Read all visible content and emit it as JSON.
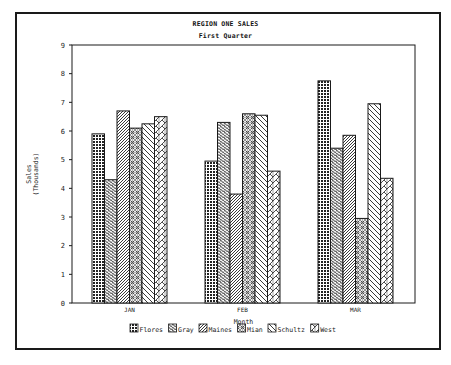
{
  "chart_data": {
    "type": "bar",
    "title": "REGION ONE SALES",
    "subtitle": "First Quarter",
    "xlabel": "Month",
    "ylabel": "Sales",
    "ylabel_sub": "(Thousands)",
    "categories": [
      "JAN",
      "FEB",
      "MAR"
    ],
    "ylim": [
      0,
      9
    ],
    "yticks": [
      0,
      1,
      2,
      3,
      4,
      5,
      6,
      7,
      8,
      9
    ],
    "grid": false,
    "legend_position": "bottom",
    "series": [
      {
        "name": "Flores",
        "pattern": "dense-dots",
        "values": [
          5.9,
          4.95,
          7.75
        ]
      },
      {
        "name": "Gray",
        "pattern": "herringbone-fine",
        "values": [
          4.3,
          6.3,
          5.4
        ]
      },
      {
        "name": "Maines",
        "pattern": "diagonal-fine",
        "values": [
          6.7,
          3.8,
          5.85
        ]
      },
      {
        "name": "Mian",
        "pattern": "crosshatch-circles",
        "values": [
          6.1,
          6.6,
          2.95
        ]
      },
      {
        "name": "Schultz",
        "pattern": "backslash",
        "values": [
          6.25,
          6.55,
          6.95
        ]
      },
      {
        "name": "West",
        "pattern": "chevron",
        "values": [
          6.5,
          4.6,
          4.35
        ]
      }
    ]
  },
  "colors": {
    "ink": "#1a1a1a",
    "background": "#ffffff"
  }
}
